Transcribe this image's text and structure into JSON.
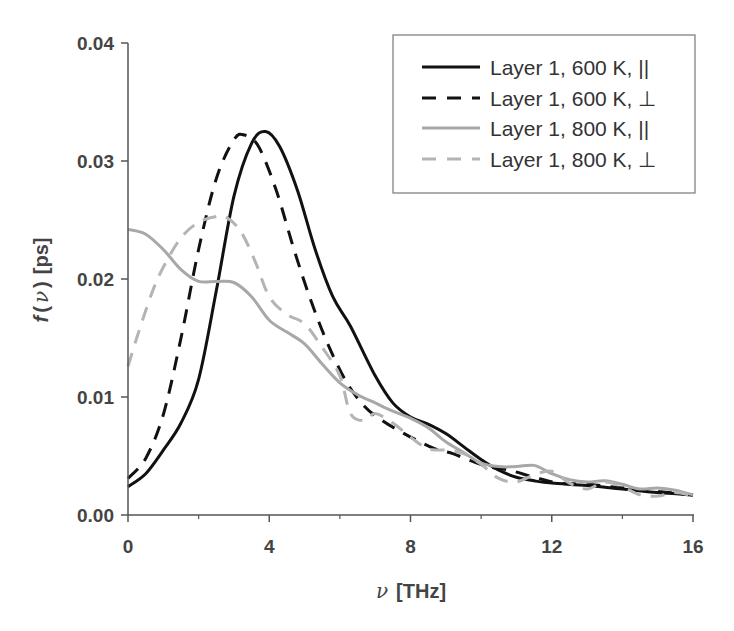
{
  "chart_data": {
    "type": "line",
    "title": "",
    "xlabel": "ν [THz]",
    "xlabel_symbol": "ν",
    "xlabel_unit": "[THz]",
    "ylabel": "f(ν) [ps]",
    "ylabel_func": "f",
    "ylabel_symbol": "ν",
    "ylabel_unit": "[ps]",
    "xlim": [
      0,
      16
    ],
    "ylim": [
      0,
      0.04
    ],
    "xticks": [
      0,
      4,
      8,
      12,
      16
    ],
    "xtick_labels": [
      "0",
      "4",
      "8",
      "12",
      "16"
    ],
    "xminor_ticks": [
      2,
      6,
      10,
      14
    ],
    "yticks": [
      0.0,
      0.01,
      0.02,
      0.03,
      0.04
    ],
    "ytick_labels": [
      "0.00",
      "0.01",
      "0.02",
      "0.03",
      "0.04"
    ],
    "grid": false,
    "legend_position": "upper right",
    "series": [
      {
        "name": "Layer 1, 600 K, ||",
        "color": "#111111",
        "dash": "solid",
        "x": [
          0,
          0.5,
          1,
          1.5,
          2,
          2.5,
          3,
          3.5,
          3.9,
          4.3,
          4.8,
          5.3,
          5.8,
          6.3,
          7,
          7.5,
          8,
          8.5,
          9,
          9.5,
          10,
          10.5,
          11,
          11.5,
          12,
          13,
          14,
          15,
          16
        ],
        "y": [
          0.0024,
          0.0035,
          0.0055,
          0.0078,
          0.0115,
          0.019,
          0.027,
          0.0315,
          0.0325,
          0.0312,
          0.0275,
          0.0225,
          0.0185,
          0.016,
          0.0118,
          0.0095,
          0.0083,
          0.0077,
          0.0069,
          0.0058,
          0.0047,
          0.0038,
          0.0032,
          0.0029,
          0.0027,
          0.0025,
          0.0022,
          0.0019,
          0.0017
        ]
      },
      {
        "name": "Layer 1, 600 K, ⊥",
        "color": "#111111",
        "dash": "dashed",
        "x": [
          0,
          0.5,
          1,
          1.5,
          2,
          2.5,
          3,
          3.3,
          3.7,
          4.2,
          4.7,
          5.2,
          5.7,
          6.2,
          6.7,
          7.2,
          7.7,
          8.2,
          8.7,
          9.2,
          9.7,
          10.2,
          10.8,
          11.5,
          12.2,
          13,
          14,
          15,
          16
        ],
        "y": [
          0.0031,
          0.0048,
          0.0085,
          0.015,
          0.0225,
          0.0285,
          0.0318,
          0.0322,
          0.0312,
          0.0275,
          0.0225,
          0.018,
          0.0142,
          0.0112,
          0.0092,
          0.008,
          0.0071,
          0.0063,
          0.0056,
          0.0052,
          0.0046,
          0.0041,
          0.0038,
          0.0032,
          0.0027,
          0.0026,
          0.0023,
          0.002,
          0.0017
        ]
      },
      {
        "name": "Layer 1, 800 K, ||",
        "color": "#a8a8a8",
        "dash": "solid",
        "x": [
          0,
          0.5,
          1,
          1.5,
          2,
          2.5,
          3,
          3.5,
          4,
          4.5,
          5,
          5.5,
          6,
          6.5,
          7,
          7.5,
          8,
          8.5,
          9,
          9.5,
          10,
          10.5,
          11,
          11.5,
          12,
          12.5,
          13,
          13.5,
          14,
          14.5,
          15,
          15.5,
          16
        ],
        "y": [
          0.0242,
          0.0238,
          0.0225,
          0.0208,
          0.0198,
          0.0198,
          0.0197,
          0.0185,
          0.0165,
          0.0155,
          0.0145,
          0.0128,
          0.0112,
          0.0102,
          0.0095,
          0.0088,
          0.0082,
          0.0074,
          0.0062,
          0.0053,
          0.0044,
          0.0041,
          0.0041,
          0.0042,
          0.0035,
          0.003,
          0.0028,
          0.0029,
          0.0026,
          0.0022,
          0.0023,
          0.0021,
          0.0017
        ]
      },
      {
        "name": "Layer 1, 800 K, ⊥",
        "color": "#b4b4b4",
        "dash": "dashed",
        "x": [
          0,
          0.3,
          0.7,
          1,
          1.5,
          2,
          2.5,
          2.8,
          3.2,
          3.6,
          4,
          4.5,
          5,
          5.5,
          6,
          6.3,
          6.7,
          7,
          7.5,
          8,
          8.5,
          9,
          9.5,
          10,
          10.5,
          11,
          11.5,
          12,
          12.5,
          13,
          13.5,
          14,
          14.5,
          15,
          15.5,
          16
        ],
        "y": [
          0.0126,
          0.0155,
          0.019,
          0.021,
          0.0235,
          0.0248,
          0.0253,
          0.0252,
          0.024,
          0.0215,
          0.0185,
          0.017,
          0.0162,
          0.0142,
          0.0118,
          0.0086,
          0.008,
          0.0086,
          0.0078,
          0.0066,
          0.0056,
          0.0055,
          0.0052,
          0.0043,
          0.0031,
          0.0028,
          0.0034,
          0.0037,
          0.0027,
          0.0022,
          0.0028,
          0.0024,
          0.0017,
          0.0016,
          0.0019,
          0.0016
        ]
      }
    ]
  },
  "legend": {
    "items": [
      {
        "label": "Layer 1, 600 K, ||"
      },
      {
        "label": "Layer 1, 600 K, ⊥"
      },
      {
        "label": "Layer 1, 800 K, ||"
      },
      {
        "label": "Layer 1, 800 K, ⊥"
      }
    ]
  }
}
